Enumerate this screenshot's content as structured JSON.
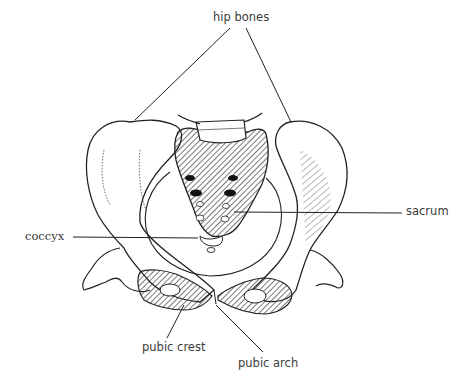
{
  "diagram": {
    "labels": {
      "hip_bones": "hip bones",
      "sacrum": "sacrum",
      "coccyx": "coccyx",
      "pubic_crest": "pubic crest",
      "pubic_arch": "pubic arch"
    },
    "colors": {
      "line": "#222222",
      "text": "#3a3a3a",
      "hatch": "#333333",
      "background": "#ffffff"
    }
  }
}
